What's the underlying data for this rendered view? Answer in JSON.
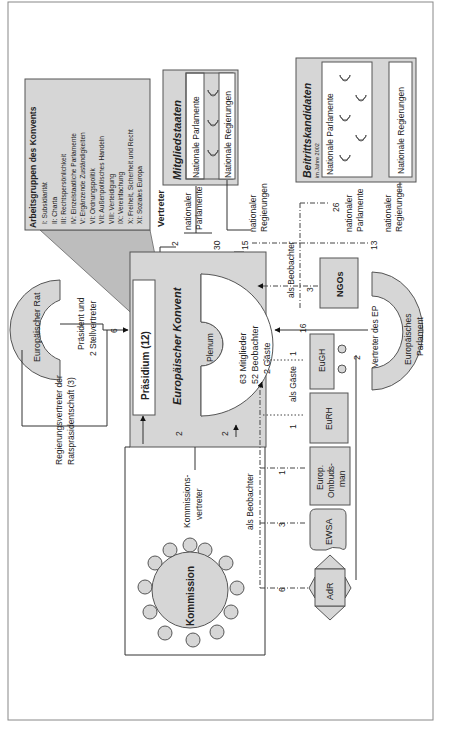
{
  "diagram": {
    "orientation": "rotated 90 degrees counter-clockwise",
    "colors": {
      "shape_fill": "#d6d6d6",
      "box_stroke": "#555555",
      "background": "#ffffff",
      "white_fill": "#ffffff"
    },
    "working_groups": {
      "title": "Arbeitsgruppen des Konvents",
      "items": [
        "I: Subsidiarität",
        "II: Charta",
        "III: Rechtspersönlichkeit",
        "IV: Einzelstaatliche Parlamente",
        "V: Ergänzende Zuständigkeiten",
        "VI: Ordnungspolitik",
        "VII: Außenpolitisches Handeln",
        "VIII: Verteidigung",
        "IX: Vereinfachung",
        "X: Freiheit, Sicherheit und Recht",
        "XI: Soziales Europa"
      ]
    },
    "mitgliedstaaten": {
      "title": "Mitgliedstaaten",
      "parliaments_label": "Nationale Parlamente",
      "governments_label": "Nationale Regierungen"
    },
    "beitrittskandidaten": {
      "title": "Beitrittskandidaten",
      "subtitle": "im Jahre 2002",
      "parliaments_label": "Nationale Parlamente",
      "governments_label": "Nationale Regierungen"
    },
    "vertreter": {
      "heading": "Vertreter",
      "national_parliaments": {
        "label_1": "nationaler",
        "label_2": "Parlamente",
        "count_praesidium": "2",
        "count_plenum": "30"
      },
      "national_governments": {
        "label_1": "nationaler",
        "label_2": "Regierungen",
        "count": "15"
      }
    },
    "candidates_observers": {
      "label": "als Beobachter",
      "parliaments": {
        "count": "26",
        "label_1": "nationaler",
        "label_2": "Parlamente"
      },
      "governments": {
        "count": "13",
        "label_1": "nationaler",
        "label_2": "Regierungen"
      }
    },
    "european_council": {
      "name": "Europäischer Rat",
      "president_label_1": "Präsident und",
      "president_label_2": "2 Stellvertreter",
      "president_count": "6",
      "presidency_label_1": "Regierungsvertreter der",
      "presidency_label_2": "Ratspräsidentschaft (3)"
    },
    "convention": {
      "title": "Europäischer Konvent",
      "praesidium": "Präsidium (12)",
      "plenum": "Plenum",
      "members": "63 Mitglieder",
      "observers": "52 Beobachter",
      "guests": "2 Gäste",
      "commission_to_praesidium": "2",
      "commission_to_plenum": "2"
    },
    "ngos": {
      "name": "NGOs",
      "count": "3"
    },
    "european_parliament": {
      "name_1": "Europäisches",
      "name_2": "Parlament",
      "rep_label": "Vertreter des EP",
      "count_plenum": "16",
      "count_praesidium": "2"
    },
    "guests": {
      "label": "als Gäste",
      "eugh": {
        "name": "EuGH",
        "count": "1"
      },
      "eurh": {
        "name": "EuRH",
        "count": "1"
      }
    },
    "observers": {
      "label": "als Beobachter",
      "ombudsman": {
        "name_1": "Europ.",
        "name_2": "Ombuds-",
        "name_3": "man",
        "count": "1"
      },
      "ewsa": {
        "name": "EWSA",
        "count": "3"
      },
      "adr": {
        "name": "AdR",
        "count": "6"
      }
    },
    "commission": {
      "name": "Kommission",
      "rep_label_1": "Kommissions-",
      "rep_label_2": "vertreter"
    }
  }
}
